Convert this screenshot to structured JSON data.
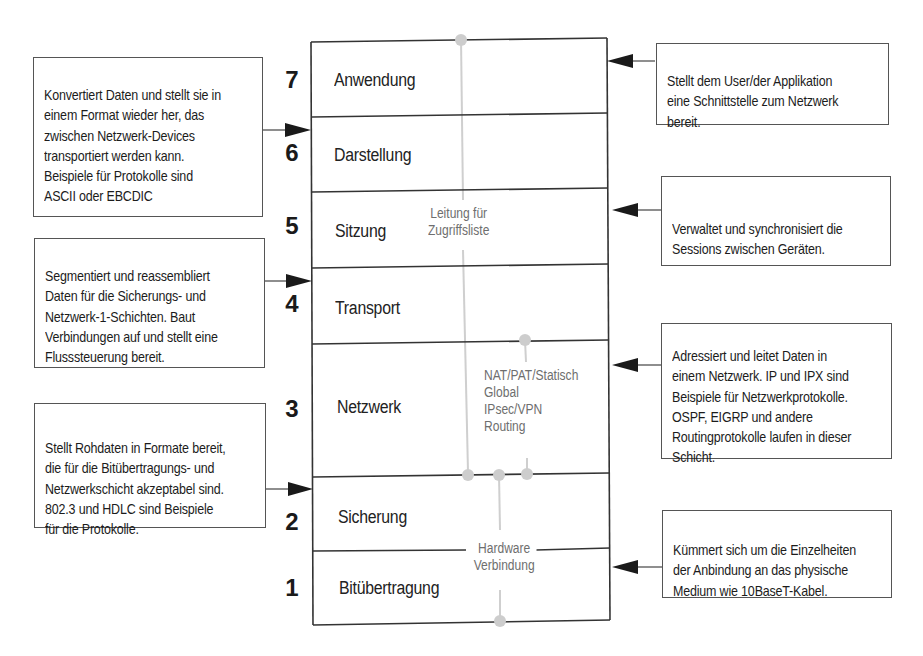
{
  "diagram": {
    "title": "",
    "colors": {
      "line": "#333333",
      "connector": "#c8c8c8",
      "box_border": "#555555",
      "gray_text": "#6e6e6e"
    },
    "layers": [
      {
        "number": "7",
        "name": "Anwendung"
      },
      {
        "number": "6",
        "name": "Darstellung"
      },
      {
        "number": "5",
        "name": "Sitzung"
      },
      {
        "number": "4",
        "name": "Transport"
      },
      {
        "number": "3",
        "name": "Netzwerk"
      },
      {
        "number": "2",
        "name": "Sicherung"
      },
      {
        "number": "1",
        "name": "Bitübertragung"
      }
    ],
    "left_descriptions": [
      {
        "target_layer": "6",
        "text": "Konvertiert Daten und stellt sie in\neinem Format wieder her, das\nzwischen Netzwerk-Devices\ntransportiert werden kann.\nBeispiele für Protokolle sind\nASCII oder EBCDIC"
      },
      {
        "target_layer": "4",
        "text": "Segmentiert und reassembliert\nDaten für die Sicherungs- und\nNetzwerk-1-Schichten. Baut\nVerbindungen auf und stellt eine\nFlusssteuerung bereit."
      },
      {
        "target_layer": "2",
        "text": "Stellt Rohdaten in Formate bereit,\ndie für die Bitübertragungs- und\nNetzwerkschicht akzeptabel sind.\n802.3 und HDLC sind Beispiele\nfür die Protokolle."
      }
    ],
    "right_descriptions": [
      {
        "target_layer": "7",
        "text": "Stellt dem User/der Applikation\neine Schnittstelle zum Netzwerk\nbereit."
      },
      {
        "target_layer": "5",
        "text": "Verwaltet und synchronisiert die\nSessions zwischen Geräten."
      },
      {
        "target_layer": "3",
        "text": "Adressiert und leitet Daten in\neinem Netzwerk. IP und IPX sind\nBeispiele für Netzwerkprotokolle.\nOSPF, EIGRP und andere\nRoutingprotokolle laufen in dieser\nSchicht."
      },
      {
        "target_layer": "1",
        "text": "Kümmert sich um die Einzelheiten\nder Anbindung an das physische\nMedium wie 10BaseT-Kabel."
      }
    ],
    "connector_labels": {
      "access_list": "Leitung für\nZugriffsliste",
      "network_features": "NAT/PAT/Statisch\nGlobal\nIPsec/VPN\nRouting",
      "hardware": "Hardware\nVerbindung"
    }
  }
}
